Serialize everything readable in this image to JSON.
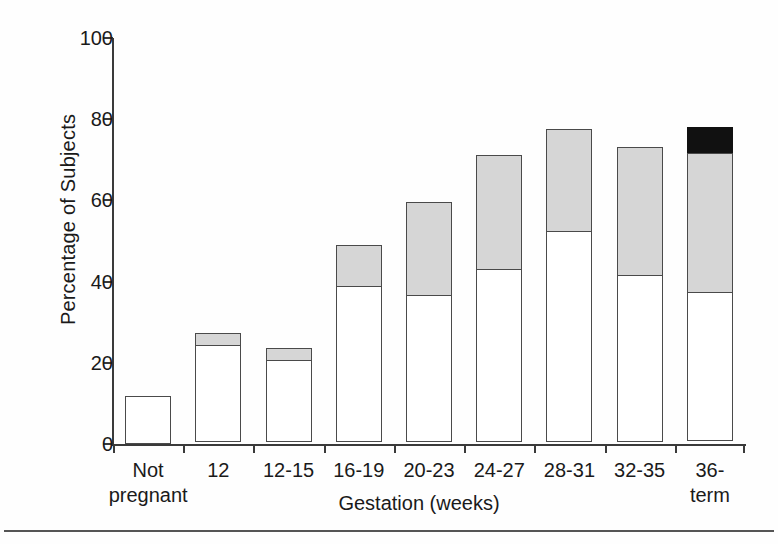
{
  "chart_data": {
    "type": "bar",
    "stacked": true,
    "title": "",
    "xlabel": "Gestation (weeks)",
    "ylabel": "Percentage of Subjects",
    "ylim": [
      0,
      100
    ],
    "yticks": [
      0,
      20,
      40,
      60,
      80,
      100
    ],
    "ytick_labels": [
      "0",
      "20",
      "40",
      "60",
      "80",
      "100"
    ],
    "grid": false,
    "legend": "none",
    "categories": [
      "Not\npregnant",
      "12",
      "12-15",
      "16-19",
      "20-23",
      "24-27",
      "28-31",
      "32-35",
      "36-term"
    ],
    "series": [
      {
        "name": "white-segment",
        "fill": "#ffffff",
        "values": [
          11.8,
          24.1,
          20.4,
          38.6,
          36.4,
          42.6,
          52.0,
          41.3,
          36.6
        ]
      },
      {
        "name": "gray-segment",
        "fill": "#d6d6d6",
        "values": [
          0,
          3.3,
          3.2,
          10.4,
          23.2,
          28.7,
          25.6,
          31.9,
          34.7
        ]
      },
      {
        "name": "black-segment",
        "fill": "#111111",
        "values": [
          0,
          0,
          0,
          0,
          0,
          0,
          0,
          0,
          6.7
        ]
      }
    ],
    "totals": [
      11.8,
      27.4,
      23.6,
      49.0,
      59.6,
      71.3,
      77.6,
      73.2,
      78.0
    ]
  },
  "colors": {
    "axis": "#3a3a3a",
    "bar_outline": "#4a4a4a",
    "background": "#ffffff",
    "white_segment": "#ffffff",
    "gray_segment": "#d6d6d6",
    "black_segment": "#111111"
  }
}
